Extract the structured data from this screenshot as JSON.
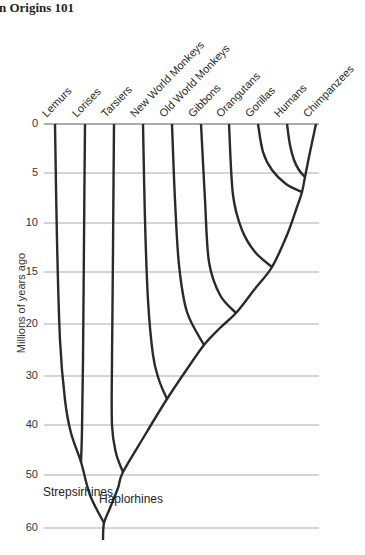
{
  "title": "n Origins 101",
  "axis": {
    "label": "Millions of years ago",
    "grid_x_start": 44,
    "grid_x_end": 319,
    "ticks": [
      {
        "label": "0",
        "value": 0,
        "y": 124
      },
      {
        "label": "5",
        "value": 5,
        "y": 173
      },
      {
        "label": "10",
        "value": 10,
        "y": 223
      },
      {
        "label": "15",
        "value": 15,
        "y": 272
      },
      {
        "label": "20",
        "value": 20,
        "y": 324
      },
      {
        "label": "30",
        "value": 30,
        "y": 376
      },
      {
        "label": "40",
        "value": 40,
        "y": 425
      },
      {
        "label": "50",
        "value": 50,
        "y": 475
      },
      {
        "label": "60",
        "value": 60,
        "y": 528
      }
    ]
  },
  "clade_labels": [
    {
      "id": "strepsirhines",
      "label": "Strepsirhines",
      "x": 43,
      "y": 485
    },
    {
      "id": "haplorhines",
      "label": "Haplorhines",
      "x": 99,
      "y": 492
    }
  ],
  "chart_data": {
    "type": "phylogenetic-tree",
    "ylabel": "Millions of years ago",
    "yticks": [
      0,
      5,
      10,
      15,
      20,
      30,
      40,
      50,
      60
    ],
    "tip_y": 124,
    "taxa": [
      {
        "name": "Lemurs",
        "x": 55
      },
      {
        "name": "Lorises",
        "x": 85
      },
      {
        "name": "Tarsiers",
        "x": 114
      },
      {
        "name": "New World Monkeys",
        "x": 143
      },
      {
        "name": "Old World Monkeys",
        "x": 172
      },
      {
        "name": "Gibbons",
        "x": 201
      },
      {
        "name": "Orangutans",
        "x": 229
      },
      {
        "name": "Gorillas",
        "x": 258
      },
      {
        "name": "Humans",
        "x": 287
      },
      {
        "name": "Chimpanzees",
        "x": 316
      }
    ],
    "divergences_mya": {
      "humans_chimpanzees": 5.5,
      "gorillas_join": 7,
      "orangutans_join": 14.5,
      "gibbons_join": 19,
      "old_world_monkeys_join": 24,
      "new_world_monkeys_join": 35,
      "lemurs_lorises": 47,
      "tarsiers_join_anthropoids": 49,
      "strepsirhines_haplorhines_root": 60
    },
    "line_color": "#2a2a2a",
    "line_width": 2.4,
    "grid_color": "#aaaaaa",
    "baseline_color": "#8f8f8f",
    "branches": [
      {
        "name": "stem-and-backbone-to-chimpanzees",
        "points": [
          [
            103,
            540
          ],
          [
            104,
            523
          ],
          [
            110,
            508
          ],
          [
            118,
            488
          ],
          [
            123,
            472
          ],
          [
            145,
            435
          ],
          [
            167,
            399
          ],
          [
            185,
            372
          ],
          [
            204,
            345
          ],
          [
            220,
            328
          ],
          [
            236,
            313
          ],
          [
            254,
            290
          ],
          [
            272,
            267
          ],
          [
            287,
            235
          ],
          [
            297,
            207
          ],
          [
            302,
            192
          ],
          [
            305,
            177
          ],
          [
            310,
            152
          ],
          [
            316,
            124
          ]
        ]
      },
      {
        "name": "lemurs-to-root",
        "points": [
          [
            55,
            124
          ],
          [
            57,
            240
          ],
          [
            60,
            340
          ],
          [
            65,
            400
          ],
          [
            71,
            433
          ],
          [
            81,
            462
          ],
          [
            90,
            495
          ],
          [
            104,
            523
          ]
        ]
      },
      {
        "name": "lorises",
        "points": [
          [
            85,
            124
          ],
          [
            84,
            240
          ],
          [
            83,
            360
          ],
          [
            82,
            430
          ],
          [
            81,
            462
          ]
        ]
      },
      {
        "name": "tarsiers",
        "points": [
          [
            114,
            124
          ],
          [
            113,
            250
          ],
          [
            112,
            360
          ],
          [
            112,
            425
          ],
          [
            116,
            453
          ],
          [
            123,
            472
          ]
        ]
      },
      {
        "name": "new-world-monkeys",
        "points": [
          [
            143,
            124
          ],
          [
            145,
            220
          ],
          [
            148,
            300
          ],
          [
            153,
            355
          ],
          [
            159,
            380
          ],
          [
            167,
            399
          ]
        ]
      },
      {
        "name": "old-world-monkeys",
        "points": [
          [
            172,
            124
          ],
          [
            175,
            200
          ],
          [
            179,
            265
          ],
          [
            187,
            312
          ],
          [
            204,
            345
          ]
        ]
      },
      {
        "name": "gibbons",
        "points": [
          [
            201,
            124
          ],
          [
            205,
            200
          ],
          [
            209,
            262
          ],
          [
            220,
            295
          ],
          [
            236,
            313
          ]
        ]
      },
      {
        "name": "orangutans",
        "points": [
          [
            229,
            124
          ],
          [
            233,
            195
          ],
          [
            242,
            230
          ],
          [
            255,
            252
          ],
          [
            272,
            267
          ]
        ]
      },
      {
        "name": "gorillas",
        "points": [
          [
            258,
            124
          ],
          [
            263,
            152
          ],
          [
            272,
            170
          ],
          [
            286,
            184
          ],
          [
            302,
            192
          ]
        ]
      },
      {
        "name": "humans",
        "points": [
          [
            287,
            124
          ],
          [
            290,
            145
          ],
          [
            294,
            160
          ],
          [
            299,
            170
          ],
          [
            305,
            177
          ]
        ]
      }
    ]
  }
}
